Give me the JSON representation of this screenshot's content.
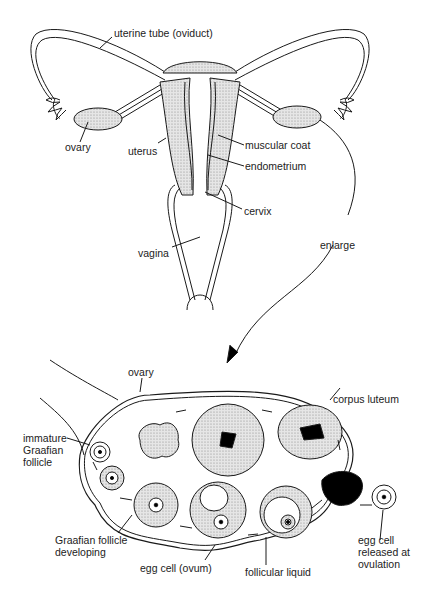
{
  "colors": {
    "stroke": "#1a1a1a",
    "fill": "#d9d9d9",
    "dark": "#000000",
    "bg": "#ffffff"
  },
  "top_labels": {
    "uterine_tube": "uterine tube (oviduct)",
    "ovary": "ovary",
    "uterus": "uterus",
    "muscular_coat": "muscular coat",
    "endometrium": "endometrium",
    "cervix": "cervix",
    "vagina": "vagina",
    "enlarge": "enlarge"
  },
  "bottom_labels": {
    "ovary": "ovary",
    "corpus_luteum": "corpus luteum",
    "immature_follicle": "immature\nGraafian\nfollicle",
    "follicle_developing": "Graafian follicle\ndeveloping",
    "egg_cell": "egg cell (ovum)",
    "follicular_liquid": "follicular liquid",
    "egg_released": "egg cell\nreleased at\novulation"
  }
}
